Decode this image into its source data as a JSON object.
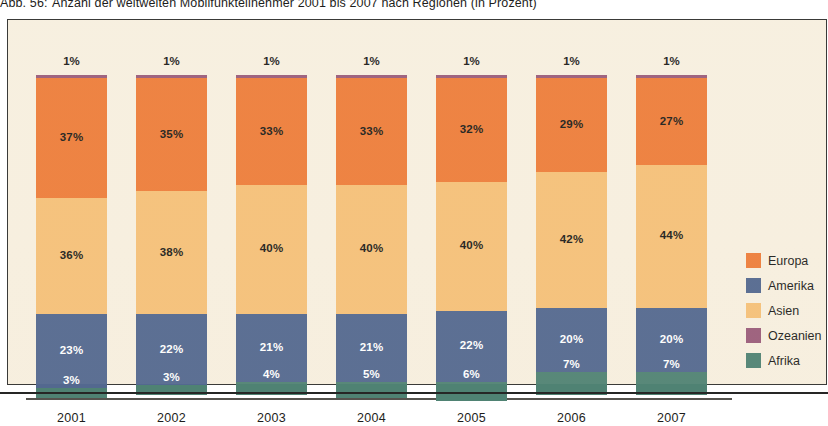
{
  "caption": {
    "number": "Abb. 56:",
    "text": "Anzahl der weltweiten Mobilfunkteilnehmer 2001 bis 2007 nach Regionen (in Prozent)"
  },
  "colors": {
    "europa": "#ED7D3A",
    "amerika": "#53688F",
    "asien": "#F5C078",
    "ozeanien": "#9A5C7A",
    "afrika": "#4F8273",
    "background": "#F7EFDF",
    "frame": "#3A3A38",
    "axis": "#55534E",
    "text_dark": "#1D1D1B",
    "text_light": "#FFFFFF"
  },
  "legend": {
    "position": "right",
    "items": [
      {
        "label": "Europa",
        "color": "#ED7D3A"
      },
      {
        "label": "Amerika",
        "color": "#53688F"
      },
      {
        "label": "Asien",
        "color": "#F5C078"
      },
      {
        "label": "Ozeanien",
        "color": "#9A5C7A"
      },
      {
        "label": "Afrika",
        "color": "#4F8273"
      }
    ]
  },
  "chart_data": {
    "type": "bar",
    "stacked": true,
    "normalized": true,
    "title": "Anzahl der weltweiten Mobilfunkteilnehmer 2001 bis 2007 nach Regionen (in Prozent)",
    "subtitle": "",
    "xlabel": "",
    "ylabel": "",
    "ylim": [
      0,
      100
    ],
    "grid": false,
    "unit": "%",
    "categories": [
      "2001",
      "2002",
      "2003",
      "2004",
      "2005",
      "2006",
      "2007"
    ],
    "series": [
      {
        "name": "Ozeanien",
        "color": "#9A5C7A",
        "values": [
          1,
          1,
          1,
          1,
          1,
          1,
          1
        ],
        "labels": [
          "1%",
          "1%",
          "1%",
          "1%",
          "1%",
          "1%",
          "1%"
        ],
        "label_placement": "outside-top",
        "label_color": "dark"
      },
      {
        "name": "Europa",
        "color": "#ED7D3A",
        "values": [
          37,
          35,
          33,
          33,
          32,
          29,
          27
        ],
        "labels": [
          "37%",
          "35%",
          "33%",
          "33%",
          "32%",
          "29%",
          "27%"
        ],
        "label_placement": "inside",
        "label_color": "dark"
      },
      {
        "name": "Asien",
        "color": "#F5C078",
        "values": [
          36,
          38,
          40,
          40,
          40,
          42,
          44
        ],
        "labels": [
          "36%",
          "38%",
          "40%",
          "40%",
          "40%",
          "42%",
          "44%"
        ],
        "label_placement": "inside",
        "label_color": "dark"
      },
      {
        "name": "Amerika",
        "color": "#53688F",
        "values": [
          23,
          22,
          21,
          21,
          22,
          20,
          20
        ],
        "labels": [
          "23%",
          "22%",
          "21%",
          "21%",
          "22%",
          "20%",
          "20%"
        ],
        "label_placement": "inside",
        "label_color": "light"
      },
      {
        "name": "Afrika",
        "color": "#4F8273",
        "values": [
          3,
          3,
          4,
          5,
          6,
          7,
          7
        ],
        "labels": [
          "3%",
          "3%",
          "4%",
          "5%",
          "6%",
          "7%",
          "7%"
        ],
        "label_placement": "inside-above",
        "label_color": "light"
      }
    ],
    "stack_order_top_to_bottom": [
      "Ozeanien",
      "Europa",
      "Asien",
      "Amerika",
      "Afrika"
    ],
    "bars": [
      {
        "year": "2001",
        "ozeanien": 1,
        "europa": 37,
        "asien": 36,
        "amerika": 23,
        "afrika": 3
      },
      {
        "year": "2002",
        "ozeanien": 1,
        "europa": 35,
        "asien": 38,
        "amerika": 22,
        "afrika": 3
      },
      {
        "year": "2003",
        "ozeanien": 1,
        "europa": 33,
        "asien": 40,
        "amerika": 21,
        "afrika": 4
      },
      {
        "year": "2004",
        "ozeanien": 1,
        "europa": 33,
        "asien": 40,
        "amerika": 21,
        "afrika": 5
      },
      {
        "year": "2005",
        "ozeanien": 1,
        "europa": 32,
        "asien": 40,
        "amerika": 22,
        "afrika": 6
      },
      {
        "year": "2006",
        "ozeanien": 1,
        "europa": 29,
        "asien": 42,
        "amerika": 20,
        "afrika": 7
      },
      {
        "year": "2007",
        "ozeanien": 1,
        "europa": 27,
        "asien": 44,
        "amerika": 20,
        "afrika": 7
      }
    ]
  }
}
